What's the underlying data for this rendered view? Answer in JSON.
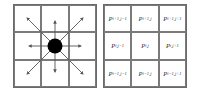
{
  "left_diagram": {
    "description": "3x3 grid with center point and arrows to 8 neighbors",
    "center_dot_color": "#000000",
    "arrow_directions": [
      "NW",
      "N",
      "NE",
      "W",
      "E",
      "SW",
      "S",
      "SE"
    ]
  },
  "right_diagram": {
    "cells": [
      {
        "base": "P",
        "sub": "i+1,j−1"
      },
      {
        "base": "P",
        "sub": "i+1,j"
      },
      {
        "base": "P",
        "sub": "i+1,j+1"
      },
      {
        "base": "P",
        "sub": "i,j−1"
      },
      {
        "base": "P",
        "sub": "i,j"
      },
      {
        "base": "P",
        "sub": "i,j+1"
      },
      {
        "base": "P",
        "sub": "i−1,j−1"
      },
      {
        "base": "P",
        "sub": "i−1,j"
      },
      {
        "base": "P",
        "sub": "i−1,j+1"
      }
    ]
  }
}
